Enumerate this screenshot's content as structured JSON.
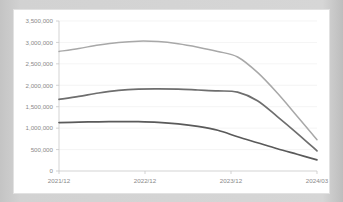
{
  "card": {
    "background_color": "#ffffff",
    "border_color": "#e2e2e2"
  },
  "page": {
    "background_color": "#d2d2d2"
  },
  "chart_data": {
    "type": "line",
    "title": "",
    "subtitle": "",
    "xlabel": "",
    "ylabel": "",
    "x": [
      "2021/12",
      "2022/12",
      "2023/12",
      "2024/03"
    ],
    "categories": [
      "2021/12",
      "2022/12",
      "2023/12",
      "2024/03"
    ],
    "xtick_labels": [
      "2021/12",
      "2022/12",
      "2023/12",
      "2024/03"
    ],
    "ytick_labels": [
      "0",
      "500,000",
      "1,000,000",
      "1,500,000",
      "2,000,000",
      "2,500,000",
      "3,000,000",
      "3,500,000"
    ],
    "ytick_values": [
      0,
      500000,
      1000000,
      1500000,
      2000000,
      2500000,
      3000000,
      3500000
    ],
    "ylim": [
      0,
      3500000
    ],
    "grid": true,
    "grid_axis": "y",
    "legend": false,
    "legend_position": "none",
    "series": [
      {
        "name": "series-1",
        "color": "#a8a8a8",
        "width": 1.5,
        "values": [
          2790000,
          3030000,
          2660000,
          730000
        ],
        "dense_values": [
          2790000,
          2860000,
          2940000,
          3000000,
          3030000,
          3020000,
          2970000,
          2890000,
          2790000,
          2660000,
          2300000,
          1820000,
          1280000,
          730000
        ]
      },
      {
        "name": "series-2",
        "color": "#6e6e6e",
        "width": 1.7,
        "values": [
          1670000,
          1910000,
          1840000,
          470000
        ],
        "dense_values": [
          1670000,
          1740000,
          1820000,
          1880000,
          1910000,
          1915000,
          1910000,
          1890000,
          1870000,
          1840000,
          1640000,
          1270000,
          880000,
          470000
        ]
      },
      {
        "name": "series-3",
        "color": "#5a5a5a",
        "width": 1.7,
        "values": [
          1130000,
          1150000,
          800000,
          260000
        ],
        "dense_values": [
          1130000,
          1140000,
          1148000,
          1152000,
          1150000,
          1135000,
          1100000,
          1040000,
          950000,
          800000,
          660000,
          520000,
          390000,
          260000
        ]
      }
    ]
  }
}
